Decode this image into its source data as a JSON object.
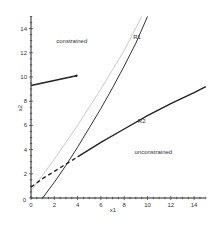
{
  "chart_data": {
    "type": "line",
    "title": "",
    "xlabel": "x1",
    "ylabel": "x2",
    "xlim": [
      0,
      15
    ],
    "ylim": [
      0,
      15
    ],
    "xticks": [
      0,
      2,
      4,
      6,
      8,
      10,
      12,
      14
    ],
    "yticks": [
      0,
      2,
      4,
      6,
      8,
      10,
      12,
      14
    ],
    "grid": false,
    "legend": null,
    "annotations": [
      {
        "text": "constrained",
        "x": 3.5,
        "y": 12.8
      },
      {
        "text": "unconstrained",
        "x": 10.5,
        "y": 3.6
      },
      {
        "text": "R1",
        "x": 9.1,
        "y": 13.1
      },
      {
        "text": "R2",
        "x": 9.5,
        "y": 6.2
      }
    ],
    "series": [
      {
        "name": "R1",
        "style": "solid",
        "color": "#333333",
        "x": [
          1.0,
          2.0,
          3.0,
          4.0,
          5.0,
          6.0,
          7.0,
          8.0,
          9.0,
          10.0
        ],
        "y": [
          0.0,
          1.3,
          2.7,
          4.2,
          5.8,
          7.4,
          9.1,
          10.9,
          12.8,
          15.0
        ]
      },
      {
        "name": "R1-light",
        "style": "solid",
        "color": "#bbbbbb",
        "x": [
          0.0,
          2.0,
          4.0,
          6.0,
          8.0,
          9.5
        ],
        "y": [
          0.6,
          3.2,
          6.0,
          9.0,
          12.2,
          15.0
        ]
      },
      {
        "name": "R2-dashed",
        "style": "dashed",
        "color": "#222222",
        "x": [
          0.0,
          1.0,
          2.0,
          3.0,
          4.0
        ],
        "y": [
          0.9,
          1.6,
          2.2,
          2.8,
          3.4
        ]
      },
      {
        "name": "R2",
        "style": "solid",
        "color": "#222222",
        "x": [
          4.0,
          6.0,
          8.0,
          10.0,
          12.0,
          14.0,
          15.0
        ],
        "y": [
          3.4,
          4.6,
          5.7,
          6.8,
          7.8,
          8.7,
          9.2
        ]
      },
      {
        "name": "constrained-segment",
        "style": "solid",
        "color": "#222222",
        "x": [
          0.0,
          3.9
        ],
        "y": [
          9.3,
          10.1
        ]
      }
    ]
  }
}
